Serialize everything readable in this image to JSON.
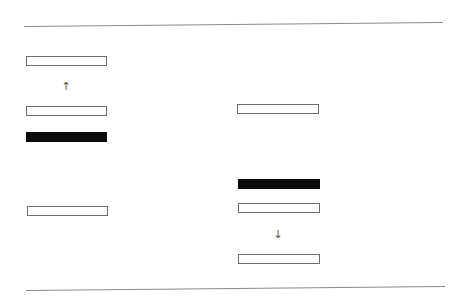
{
  "diagram": {
    "rules": [
      {
        "name": "top-rule",
        "x1": 24,
        "y1": 26,
        "x2": 443,
        "y2": 22
      },
      {
        "name": "bottom-rule",
        "x1": 26,
        "y1": 290,
        "x2": 445,
        "y2": 286
      }
    ],
    "left_column": {
      "elements": [
        {
          "type": "box",
          "x": 26,
          "y": 56,
          "w": 81,
          "filled": false
        },
        {
          "type": "arrow",
          "x": 61,
          "y": 81,
          "glyph": "↑",
          "direction": "up"
        },
        {
          "type": "box",
          "x": 26,
          "y": 106,
          "w": 81,
          "filled": false
        },
        {
          "type": "box",
          "x": 26,
          "y": 132,
          "w": 81,
          "filled": true
        },
        {
          "type": "box",
          "x": 27,
          "y": 206,
          "w": 81,
          "filled": false
        }
      ]
    },
    "right_column": {
      "elements": [
        {
          "type": "box",
          "x": 237,
          "y": 104,
          "w": 82,
          "filled": false
        },
        {
          "type": "box",
          "x": 238,
          "y": 179,
          "w": 82,
          "filled": true
        },
        {
          "type": "box",
          "x": 238,
          "y": 203,
          "w": 82,
          "filled": false
        },
        {
          "type": "arrow",
          "x": 273,
          "y": 229,
          "glyph": "↓",
          "direction": "down"
        },
        {
          "type": "box",
          "x": 238,
          "y": 254,
          "w": 82,
          "filled": false
        }
      ]
    },
    "colors": {
      "line": "#8a8a8a",
      "box_border": "#6e6e6e",
      "box_fill": "#0a0a0a",
      "arrow": "#555555"
    }
  }
}
